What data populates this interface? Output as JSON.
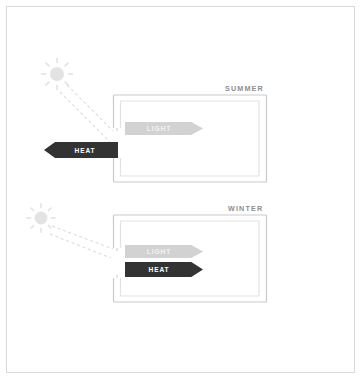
{
  "diagram": {
    "title_visible": false,
    "frame_color": "#d9d9d9",
    "background": "#ffffff"
  },
  "panels": [
    {
      "id": "summer",
      "label": "SUMMER",
      "label_color": "#8e8e8e",
      "sun": {
        "icon": "sun-icon",
        "position": "high",
        "color": "#e2e2e2",
        "rays": 8
      },
      "sunbeams": {
        "icon": "dashed-ray-lines",
        "count": 2,
        "angle": "steep",
        "color": "#dcdcdc"
      },
      "flows": [
        {
          "label": "LIGHT",
          "direction": "right",
          "fill": "#d2d2d2",
          "text_color": "#f2f2f2",
          "location": "inside"
        },
        {
          "label": "HEAT",
          "direction": "left",
          "fill": "#333333",
          "text_color": "#ffffff",
          "location": "outside"
        }
      ]
    },
    {
      "id": "winter",
      "label": "WINTER",
      "label_color": "#8e8e8e",
      "sun": {
        "icon": "sun-icon",
        "position": "low",
        "color": "#e2e2e2",
        "rays": 8
      },
      "sunbeams": {
        "icon": "dashed-ray-lines",
        "count": 2,
        "angle": "shallow",
        "color": "#dcdcdc"
      },
      "flows": [
        {
          "label": "LIGHT",
          "direction": "right",
          "fill": "#d2d2d2",
          "text_color": "#f2f2f2",
          "location": "inside"
        },
        {
          "label": "HEAT",
          "direction": "right",
          "fill": "#333333",
          "text_color": "#ffffff",
          "location": "inside"
        }
      ]
    }
  ],
  "building": {
    "outer_wall_color": "#c9c9c9",
    "inner_wall_color": "#e0e0e0",
    "window_gap": true
  }
}
